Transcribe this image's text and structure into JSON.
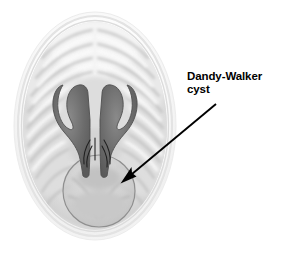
{
  "figure": {
    "name": "dandy-walker-cyst-axial-brain-illustration",
    "modality": "axial cross-section medical illustration",
    "background_color": "#ffffff",
    "width": 284,
    "height": 253
  },
  "annotation": {
    "label_line_1": "Dandy-Walker",
    "label_line_2": "cyst",
    "full_text": "Dandy-Walker cyst",
    "text_color": "#000000",
    "arrow_color": "#000000",
    "arrow_tail": {
      "x": 216,
      "y": 104
    },
    "arrow_head": {
      "x": 121,
      "y": 183
    }
  },
  "anatomy": {
    "skull": {
      "name": "skull-outline",
      "center_x": 95,
      "center_y": 126,
      "radius_x": 81,
      "radius_y": 114,
      "outer_color": "#f2f2f2",
      "inner_color": "#fbfbfb"
    },
    "brain": {
      "name": "brain-parenchyma",
      "center_x": 95,
      "center_y": 126,
      "radius_x": 72,
      "radius_y": 104,
      "fill_light": "#f6f6f6",
      "fill_mid": "#d8d8d8",
      "fill_dark": "#b4b4b4"
    },
    "ventricles": {
      "name": "lateral-ventricles",
      "description": "dilated horn-shaped lateral ventricles",
      "fill_color": "#6f6f6f",
      "stroke_color": "#4a4a4a"
    },
    "cyst": {
      "name": "dandy-walker-cyst",
      "description": "large posterior fossa cyst",
      "center_x": 99,
      "center_y": 191,
      "radius": 36,
      "stroke_color": "#8c8c8c",
      "fill_color": "#cfcfcf"
    },
    "midline": {
      "name": "interhemispheric-fissure",
      "color": "#9a9a9a"
    }
  }
}
